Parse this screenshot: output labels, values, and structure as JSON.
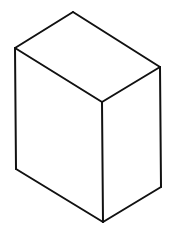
{
  "diagram": {
    "type": "isometric-rectangular-prism",
    "background": "#ffffff",
    "stroke_color": "#111111",
    "stroke_width": 2,
    "vertices": {
      "top_back": [
        73,
        12
      ],
      "top_left": [
        15,
        48
      ],
      "top_right": [
        160,
        67
      ],
      "top_front": [
        102,
        102
      ],
      "bottom_left": [
        16,
        169
      ],
      "bottom_right": [
        161,
        187
      ],
      "bottom_front": [
        103,
        222
      ]
    },
    "faces": [
      {
        "name": "top-face",
        "points": "73,12 160,67 102,102 15,48"
      },
      {
        "name": "left-face",
        "points": "15,48 102,102 103,222 16,169"
      },
      {
        "name": "right-face",
        "points": "102,102 160,67 161,187 103,222"
      }
    ],
    "edges": [
      {
        "name": "edge-top-back-left",
        "x1": 73,
        "y1": 12,
        "x2": 15,
        "y2": 48
      },
      {
        "name": "edge-top-back-right",
        "x1": 73,
        "y1": 12,
        "x2": 160,
        "y2": 67
      },
      {
        "name": "edge-top-front-left",
        "x1": 15,
        "y1": 48,
        "x2": 102,
        "y2": 102
      },
      {
        "name": "edge-top-front-right",
        "x1": 160,
        "y1": 67,
        "x2": 102,
        "y2": 102
      },
      {
        "name": "edge-vertical-left",
        "x1": 15,
        "y1": 48,
        "x2": 16,
        "y2": 169
      },
      {
        "name": "edge-vertical-front",
        "x1": 102,
        "y1": 102,
        "x2": 103,
        "y2": 222
      },
      {
        "name": "edge-vertical-right",
        "x1": 160,
        "y1": 67,
        "x2": 161,
        "y2": 187
      },
      {
        "name": "edge-bottom-left",
        "x1": 16,
        "y1": 169,
        "x2": 103,
        "y2": 222
      },
      {
        "name": "edge-bottom-right",
        "x1": 161,
        "y1": 187,
        "x2": 103,
        "y2": 222
      }
    ]
  }
}
